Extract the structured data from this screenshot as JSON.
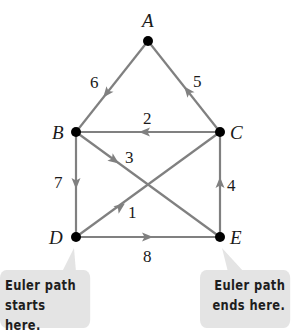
{
  "diagram": {
    "type": "directed-graph",
    "title": "",
    "colors": {
      "edge": "#808080",
      "vertex": "#000000",
      "label": "#1a1a1a",
      "callout_bg": "#e4e4e4",
      "callout_text": "#1e1e1e"
    },
    "vertices": [
      {
        "id": "A",
        "label": "A",
        "x": 148,
        "y": 41
      },
      {
        "id": "B",
        "label": "B",
        "x": 76,
        "y": 132
      },
      {
        "id": "C",
        "label": "C",
        "x": 220,
        "y": 132
      },
      {
        "id": "D",
        "label": "D",
        "x": 76,
        "y": 237
      },
      {
        "id": "E",
        "label": "E",
        "x": 220,
        "y": 237
      }
    ],
    "edges": [
      {
        "order": "1",
        "from": "D",
        "to": "C"
      },
      {
        "order": "2",
        "from": "C",
        "to": "B"
      },
      {
        "order": "3",
        "from": "B",
        "to": "E"
      },
      {
        "order": "4",
        "from": "E",
        "to": "C"
      },
      {
        "order": "5",
        "from": "C",
        "to": "A"
      },
      {
        "order": "6",
        "from": "A",
        "to": "B"
      },
      {
        "order": "7",
        "from": "B",
        "to": "D"
      },
      {
        "order": "8",
        "from": "D",
        "to": "E"
      }
    ],
    "callouts": {
      "start": {
        "line1": "Euler path",
        "line2": "starts here.",
        "points_to": "D"
      },
      "end": {
        "line1": "Euler path",
        "line2": "ends here.",
        "points_to": "E"
      }
    }
  }
}
